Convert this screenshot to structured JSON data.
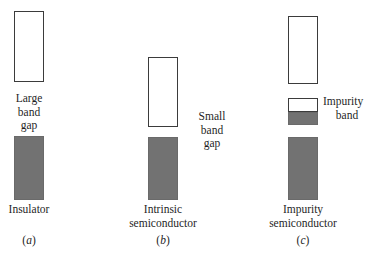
{
  "figure": {
    "type": "energy-band-diagram",
    "background_color": "#ffffff",
    "conduction_band_fill": "#ffffff",
    "conduction_band_stroke": "#3b3b3b",
    "valence_band_fill": "#727272",
    "panels": [
      {
        "id": "a",
        "subfig_label": "(a)",
        "caption": "Insulator",
        "gap_label_lines": [
          "Large",
          "band",
          "gap"
        ],
        "gap_label_position": "below-conduction-centered",
        "impurity_band_label_lines": [],
        "bands": [
          {
            "name": "conduction-band",
            "fill": "white",
            "x": 14,
            "y": 11,
            "w": 30,
            "h": 71
          },
          {
            "name": "valence-band",
            "fill": "gray",
            "x": 14,
            "y": 136,
            "w": 30,
            "h": 64
          }
        ]
      },
      {
        "id": "b",
        "subfig_label": "(b)",
        "caption_lines": [
          "Intrinsic",
          "semiconductor"
        ],
        "gap_label_lines": [
          "Small",
          "band",
          "gap"
        ],
        "gap_label_position": "right-of-gap",
        "impurity_band_label_lines": [],
        "bands": [
          {
            "name": "conduction-band",
            "fill": "white",
            "x": 148,
            "y": 57,
            "w": 30,
            "h": 70
          },
          {
            "name": "valence-band",
            "fill": "gray",
            "x": 148,
            "y": 137,
            "w": 30,
            "h": 63
          }
        ]
      },
      {
        "id": "c",
        "subfig_label": "(c)",
        "caption_lines": [
          "Impurity",
          "semiconductor"
        ],
        "gap_label_lines": [],
        "impurity_band_label_lines": [
          "Impurity",
          "band"
        ],
        "impurity_band_label_position": "right-of-impurity-band",
        "bands": [
          {
            "name": "conduction-band",
            "fill": "white",
            "x": 288,
            "y": 16,
            "w": 30,
            "h": 68
          },
          {
            "name": "donor-level-box",
            "fill": "white",
            "x": 288,
            "y": 98,
            "w": 30,
            "h": 14
          },
          {
            "name": "impurity-band",
            "fill": "gray",
            "x": 288,
            "y": 112,
            "w": 30,
            "h": 13
          },
          {
            "name": "valence-band",
            "fill": "gray",
            "x": 288,
            "y": 137,
            "w": 30,
            "h": 63
          }
        ]
      }
    ]
  },
  "labels": {
    "panel_a": {
      "gap_line1": "Large",
      "gap_line2": "band",
      "gap_line3": "gap",
      "caption": "Insulator",
      "subfig_open": "(",
      "subfig_letter": "a",
      "subfig_close": ")"
    },
    "panel_b": {
      "gap_line1": "Small",
      "gap_line2": "band",
      "gap_line3": "gap",
      "caption_line1": "Intrinsic",
      "caption_line2": "semiconductor",
      "subfig_open": "(",
      "subfig_letter": "b",
      "subfig_close": ")"
    },
    "panel_c": {
      "impurity_line1": "Impurity",
      "impurity_line2": "band",
      "caption_line1": "Impurity",
      "caption_line2": "semiconductor",
      "subfig_open": "(",
      "subfig_letter": "c",
      "subfig_close": ")"
    }
  }
}
